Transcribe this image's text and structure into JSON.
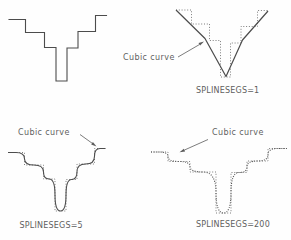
{
  "canvas": {
    "width": 291,
    "height": 240,
    "background": "#fefefe"
  },
  "colors": {
    "solid_line": "#4c4c4c",
    "dotted_frame": "#6e6e6e",
    "dotted_curve": "#555555",
    "leader": "#5a5a5a",
    "text": "#5e5e5e"
  },
  "figures": {
    "top_right": {
      "label": "Cubic curve",
      "caption": "SPLINESEGS=1"
    },
    "bottom_left": {
      "label": "Cubic curve",
      "caption": "SPLINESEGS=5"
    },
    "bottom_right": {
      "label": "Cubic curve",
      "caption": "SPLINESEGS=200"
    }
  }
}
